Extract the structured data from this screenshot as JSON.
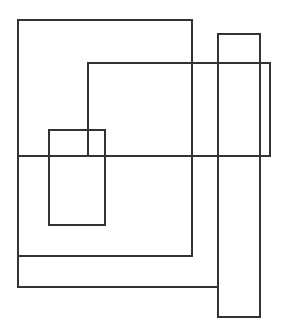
{
  "canvas": {
    "width": 283,
    "height": 331,
    "background": "#ffffff",
    "stroke": "#333333",
    "stroke_width": 2
  },
  "rectangles": [
    {
      "id": "rect-large-left",
      "x": 17,
      "y": 19,
      "w": 176,
      "h": 238
    },
    {
      "id": "rect-tall-right",
      "x": 217,
      "y": 33,
      "w": 44,
      "h": 285
    },
    {
      "id": "rect-wide-middle",
      "x": 87,
      "y": 62,
      "w": 184,
      "h": 95
    },
    {
      "id": "rect-small-inner",
      "x": 48,
      "y": 129,
      "w": 58,
      "h": 97
    },
    {
      "id": "rect-bottom-left",
      "x": 17,
      "y": 155,
      "w": 202,
      "h": 133
    }
  ]
}
